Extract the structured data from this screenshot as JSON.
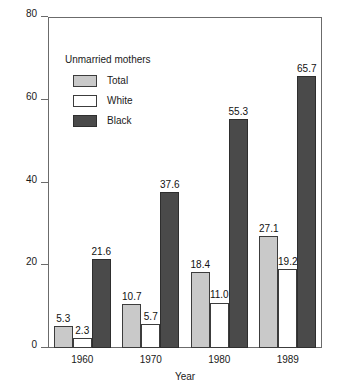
{
  "chart_data": {
    "type": "bar",
    "title": "",
    "xlabel": "Year",
    "ylabel": "Percent",
    "categories": [
      "1960",
      "1970",
      "1980",
      "1989"
    ],
    "series": [
      {
        "name": "Total",
        "color": "#c9c9c9",
        "values": [
          5.3,
          10.7,
          18.4,
          27.1
        ]
      },
      {
        "name": "White",
        "color": "#ffffff",
        "values": [
          2.3,
          5.7,
          11.0,
          19.2
        ]
      },
      {
        "name": "Black",
        "color": "#4a4a4a",
        "values": [
          21.6,
          37.6,
          55.3,
          65.7
        ]
      }
    ],
    "value_labels": [
      [
        "5.3",
        "2.3",
        "21.6"
      ],
      [
        "10.7",
        "5.7",
        "37.6"
      ],
      [
        "18.4",
        "11.0",
        "55.3"
      ],
      [
        "27.1",
        "19.2",
        "65.7"
      ]
    ],
    "ylim": [
      0,
      80
    ],
    "yticks": [
      0,
      20,
      40,
      60,
      80
    ],
    "ytick_labels": [
      "0",
      "20",
      "40",
      "60",
      "80"
    ],
    "grid": false,
    "legend": {
      "position": "inside-top-left",
      "title": "Unmarried mothers",
      "entries": [
        {
          "label": "Total",
          "swatch": "total"
        },
        {
          "label": "White",
          "swatch": "white"
        },
        {
          "label": "Black",
          "swatch": "black"
        }
      ]
    }
  }
}
